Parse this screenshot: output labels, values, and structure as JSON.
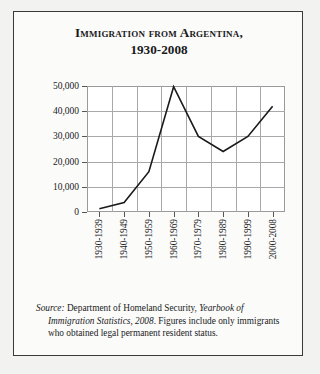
{
  "card": {
    "title_line1": "Immigration from Argentina,",
    "title_line2": "1930-2008"
  },
  "source": {
    "label": "Source:",
    "agency": " Department of Homeland Security, ",
    "publication": "Yearbook of Immigration Statistics, 2008",
    "note": ". Figures include only immigrants who obtained legal permanent resident status."
  },
  "chart_data": {
    "type": "line",
    "title": "Immigration from Argentina, 1930-2008",
    "xlabel": "",
    "ylabel": "Total immigrants per decade",
    "categories": [
      "1930-1939",
      "1940-1949",
      "1950-1959",
      "1960-1969",
      "1970-1979",
      "1980-1989",
      "1990-1999",
      "2000-2008"
    ],
    "values": [
      1300,
      3800,
      16000,
      49700,
      30000,
      24000,
      30000,
      42000
    ],
    "ytick_labels": [
      "50,000",
      "40,000",
      "30,000",
      "20,000",
      "10,000",
      "0"
    ],
    "ytick_values": [
      50000,
      40000,
      30000,
      20000,
      10000,
      0
    ],
    "ylim": [
      0,
      50000
    ],
    "grid": true,
    "legend": "none",
    "line_color": "#1a1a1a"
  }
}
